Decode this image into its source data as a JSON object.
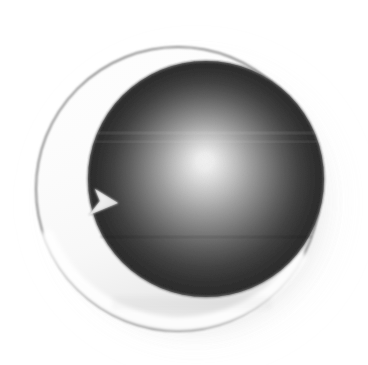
{
  "image": {
    "title": "Sphere Refresh Logo",
    "alt_text": "Dark gradient sphere set inside a white crescent ring with a small arrowhead",
    "width": 368,
    "height": 365,
    "background_color": "#ffffff"
  },
  "graphic": {
    "shapes": [
      {
        "name": "drop-shadow",
        "kind": "soft-radial-shadow",
        "center_x": 190,
        "center_y": 198,
        "radius": 152,
        "color": "#9a9a9a",
        "opacity": 0.85
      },
      {
        "name": "outer-ring-disc",
        "kind": "circle",
        "center_x": 178,
        "center_y": 189,
        "radius": 143,
        "fill_color": "#fdfdfd",
        "stroke_color": "#8c8c8c",
        "stroke_width": 2
      },
      {
        "name": "inner-sphere",
        "kind": "circle",
        "center_x": 206,
        "center_y": 179,
        "radius": 118,
        "highlight_x": 205,
        "highlight_y": 170,
        "highlight_color": "#f2f2f2",
        "midtone_color": "#9a9a9a",
        "edge_color": "#2b2b2b"
      },
      {
        "name": "refresh-arrowhead",
        "kind": "triangle",
        "points": "90,214 117,203 96,190",
        "fill_color": "#ededed",
        "stroke_color": "#b5b5b5"
      }
    ],
    "colors": {
      "page_background": "#ffffff",
      "ring_fill": "#fdfdfd",
      "ring_outline": "#8c8c8c",
      "sphere_highlight": "#f2f2f2",
      "sphere_mid": "#9a9a9a",
      "sphere_edge": "#2b2b2b",
      "shadow": "#9a9a9a",
      "arrow_fill": "#ededed"
    }
  }
}
